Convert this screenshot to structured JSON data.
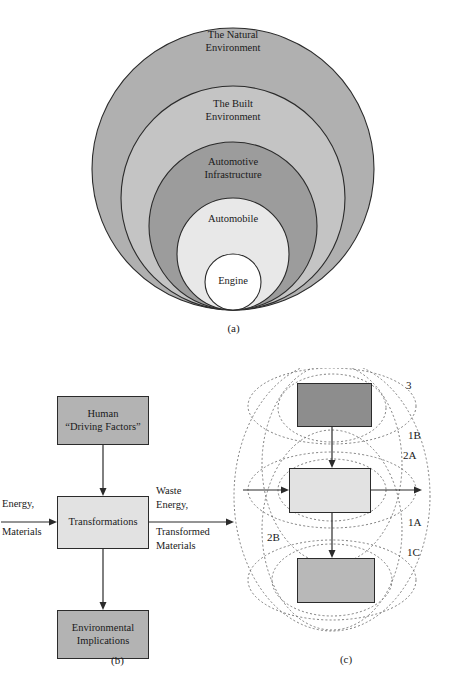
{
  "figure": {
    "panels": [
      {
        "id": "a",
        "caption": "(a)"
      },
      {
        "id": "b",
        "caption": "(b)"
      },
      {
        "id": "c",
        "caption": "(c)"
      }
    ]
  },
  "panel_a": {
    "type": "nested-circles",
    "description": "Concentric nested circles tangent at the bottom, from largest outer to smallest inner",
    "rings": [
      {
        "index": 1,
        "line1": "The Natural",
        "line2": "Environment",
        "fill": "#b0b0b0"
      },
      {
        "index": 2,
        "line1": "The Built",
        "line2": "Environment",
        "fill": "#c4c4c4"
      },
      {
        "index": 3,
        "line1": "Automotive",
        "line2": "Infrastructure",
        "fill": "#9c9c9c"
      },
      {
        "index": 4,
        "line1": "Automobile",
        "line2": "",
        "fill": "#e8e8e8"
      },
      {
        "index": 5,
        "line1": "Engine",
        "line2": "",
        "fill": "#ffffff"
      }
    ],
    "stroke": "#2b2b2b"
  },
  "panel_b": {
    "type": "flow-diagram",
    "boxes": [
      {
        "id": "human",
        "line1": "Human",
        "line2": "“Driving Factors”",
        "fill": "#b3b3b3"
      },
      {
        "id": "transformations",
        "line1": "Transformations",
        "line2": "",
        "fill": "#e2e2e2"
      },
      {
        "id": "environmental",
        "line1": "Environmental",
        "line2": "Implications",
        "fill": "#b3b3b3"
      }
    ],
    "inputs": {
      "line1": "Energy,",
      "line2": "Materials"
    },
    "outputs": {
      "line1": "Waste",
      "line2": "Energy,",
      "line3": "Transformed",
      "line4": "Materials"
    }
  },
  "panel_c": {
    "type": "venn-overlay-diagram",
    "boxes": [
      {
        "id": "top",
        "fill": "#8d8d8d"
      },
      {
        "id": "mid",
        "fill": "#e2e2e2"
      },
      {
        "id": "bottom",
        "fill": "#b8b8b8"
      }
    ],
    "region_labels": [
      {
        "id": "3",
        "text": "3"
      },
      {
        "id": "1B",
        "text": "1B"
      },
      {
        "id": "2A",
        "text": "2A"
      },
      {
        "id": "1A",
        "text": "1A"
      },
      {
        "id": "2B",
        "text": "2B"
      },
      {
        "id": "1C",
        "text": "1C"
      }
    ],
    "ellipse_stroke": "#6f6f6f"
  }
}
